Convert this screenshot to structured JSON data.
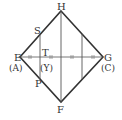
{
  "diagram": {
    "type": "geometry-figure",
    "shape": "square rotated 45deg (rhombus) with vertical lines and horizontal diagonal",
    "points": {
      "H": {
        "label": "H",
        "x": 61,
        "y": 11
      },
      "E": {
        "label": "E",
        "alt": "(A)",
        "x": 20,
        "y": 57
      },
      "G": {
        "label": "G",
        "alt": "(C)",
        "x": 103,
        "y": 57
      },
      "F": {
        "label": "F",
        "x": 61,
        "y": 102
      },
      "S": {
        "label": "S",
        "x": 40,
        "y": 34
      },
      "P": {
        "label": "P",
        "x": 40,
        "y": 79
      },
      "T": {
        "label": "T",
        "alt": "(Y)",
        "x": 40,
        "y": 57
      }
    },
    "labels": {
      "H": "H",
      "E": "E",
      "A": "(A)",
      "G": "G",
      "C": "(C)",
      "F": "F",
      "S": "S",
      "P": "P",
      "T": "T",
      "Y": "(Y)"
    },
    "tick_marks": "double ticks marking equal segments on E–G",
    "colors": {
      "line": "#333333",
      "background": "#ffffff"
    }
  }
}
